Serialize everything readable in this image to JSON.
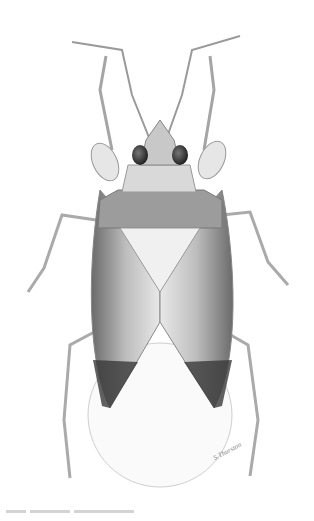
{
  "illustration": {
    "subject": "insect-dorsal-view",
    "style": "pencil-stipple",
    "colors": {
      "background": "#ffffff",
      "dark": "#2a2a2a",
      "mid": "#8a8a8a",
      "light": "#d8d8d8",
      "outline": "#9a9a9a"
    }
  },
  "signature": {
    "text": "S.Thurston"
  }
}
